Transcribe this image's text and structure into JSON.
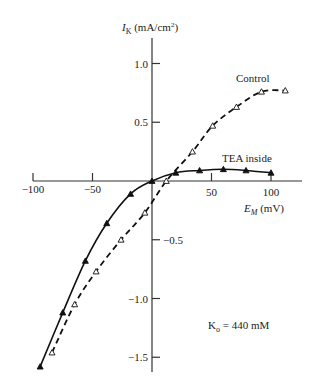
{
  "chart_data": {
    "type": "line",
    "title": "",
    "xlabel": "E_M (mV)",
    "ylabel": "I_K (mA/cm²)",
    "xlim": [
      -100,
      115
    ],
    "ylim": [
      -1.6,
      1.2
    ],
    "x_ticks": [
      -100,
      -50,
      50,
      100
    ],
    "x_tick_labels": [
      "−100",
      "−50",
      "50",
      "100"
    ],
    "y_ticks": [
      1.0,
      0.5,
      -0.5,
      -1.0,
      -1.5
    ],
    "y_tick_labels": [
      "1.0",
      "0.5",
      "−0.5",
      "−1.0",
      "−1.5"
    ],
    "grid": false,
    "axes_through_origin": true,
    "series": [
      {
        "name": "Control",
        "line_style": "dashed",
        "marker": "open-triangle",
        "color": "#111111",
        "x": [
          -84,
          -65,
          -47,
          -26,
          -6,
          12,
          34,
          51,
          71,
          92,
          112
        ],
        "values": [
          -1.46,
          -1.05,
          -0.77,
          -0.5,
          -0.27,
          0.0,
          0.25,
          0.47,
          0.63,
          0.76,
          0.77
        ]
      },
      {
        "name": "TEA inside",
        "line_style": "solid",
        "marker": "filled-triangle",
        "color": "#111111",
        "x": [
          -94,
          -75,
          -56,
          -38,
          -18,
          0,
          20,
          40,
          60,
          79,
          100
        ],
        "values": [
          -1.58,
          -1.12,
          -0.68,
          -0.36,
          -0.11,
          0.0,
          0.07,
          0.09,
          0.1,
          0.09,
          0.07
        ]
      }
    ],
    "annotations": [
      {
        "text": "Kₒ = 440 mM",
        "x": 65,
        "y": -1.2
      }
    ]
  },
  "labels": {
    "y_axis_title_main": "I",
    "y_axis_title_sub": "K",
    "y_axis_title_units": " (mA/cm",
    "y_axis_title_sup": "2",
    "y_axis_title_close": ")",
    "x_axis_title_main": "E",
    "x_axis_title_sub": "M",
    "x_axis_title_units": " (mV)",
    "control": "Control",
    "tea": "TEA inside",
    "annotation_main": "K",
    "annotation_sub": "o",
    "annotation_rest": " = 440 mM"
  }
}
